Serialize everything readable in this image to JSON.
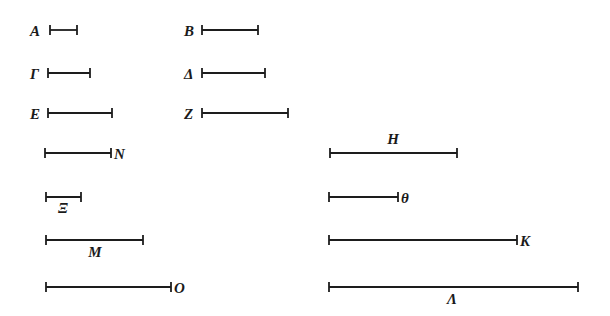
{
  "figure": {
    "background_color": "#ffffff",
    "line_color": "#1d1d1d",
    "label_color": "#1a1a1a",
    "width": 610,
    "height": 316,
    "stroke_width": 1.8,
    "tick_half_height": 5
  },
  "chart_data": {
    "type": "bar",
    "xlabel": "",
    "ylabel": "",
    "orientation": "horizontal",
    "grid": false,
    "legend": false,
    "note": "Each entry is a horizontal line segment drawn with end ticks; value = pixel length of the segment.",
    "categories": [
      "A",
      "B",
      "Γ",
      "Δ",
      "E",
      "Z",
      "N",
      "H",
      "Ξ",
      "θ",
      "M",
      "K",
      "O",
      "Λ"
    ],
    "values": [
      27,
      56,
      42,
      63,
      64,
      86,
      66,
      127,
      35,
      69,
      97,
      188,
      125,
      249
    ]
  },
  "segments": [
    {
      "id": "segment-alpha",
      "label": "A",
      "label_position": "left",
      "x1": 50,
      "x2": 77,
      "y": 30,
      "length": 27,
      "label_x": 30,
      "label_y": 36
    },
    {
      "id": "segment-beta",
      "label": "B",
      "label_position": "left",
      "x1": 202,
      "x2": 258,
      "y": 30,
      "length": 56,
      "label_x": 184,
      "label_y": 36
    },
    {
      "id": "segment-gamma",
      "label": "Γ",
      "label_position": "left",
      "x1": 48,
      "x2": 90,
      "y": 73,
      "length": 42,
      "label_x": 30,
      "label_y": 79
    },
    {
      "id": "segment-delta",
      "label": "Δ",
      "label_position": "left",
      "x1": 202,
      "x2": 265,
      "y": 73,
      "length": 63,
      "label_x": 184,
      "label_y": 79
    },
    {
      "id": "segment-epsilon",
      "label": "E",
      "label_position": "left",
      "x1": 48,
      "x2": 112,
      "y": 113,
      "length": 64,
      "label_x": 30,
      "label_y": 119
    },
    {
      "id": "segment-zeta",
      "label": "Z",
      "label_position": "left",
      "x1": 202,
      "x2": 288,
      "y": 113,
      "length": 86,
      "label_x": 184,
      "label_y": 119
    },
    {
      "id": "segment-nu",
      "label": "N",
      "label_position": "right",
      "x1": 45,
      "x2": 111,
      "y": 153,
      "length": 66,
      "label_x": 114,
      "label_y": 159
    },
    {
      "id": "segment-eta",
      "label": "H",
      "label_position": "above",
      "x1": 330,
      "x2": 457,
      "y": 153,
      "length": 127,
      "label_x": 393,
      "label_y": 144
    },
    {
      "id": "segment-xi",
      "label": "Ξ",
      "label_position": "below",
      "x1": 46,
      "x2": 81,
      "y": 197,
      "length": 35,
      "label_x": 63,
      "label_y": 213
    },
    {
      "id": "segment-theta",
      "label": "θ",
      "label_position": "right",
      "x1": 329,
      "x2": 398,
      "y": 197,
      "length": 69,
      "label_x": 401,
      "label_y": 203
    },
    {
      "id": "segment-mu",
      "label": "M",
      "label_position": "below",
      "x1": 46,
      "x2": 143,
      "y": 240,
      "length": 97,
      "label_x": 95,
      "label_y": 257
    },
    {
      "id": "segment-kappa",
      "label": "K",
      "label_position": "right",
      "x1": 329,
      "x2": 517,
      "y": 240,
      "length": 188,
      "label_x": 520,
      "label_y": 246
    },
    {
      "id": "segment-omicron",
      "label": "O",
      "label_position": "right",
      "x1": 46,
      "x2": 171,
      "y": 287,
      "length": 125,
      "label_x": 174,
      "label_y": 293
    },
    {
      "id": "segment-lambda",
      "label": "Λ",
      "label_position": "below",
      "x1": 329,
      "x2": 578,
      "y": 287,
      "length": 249,
      "label_x": 452,
      "label_y": 304
    }
  ]
}
